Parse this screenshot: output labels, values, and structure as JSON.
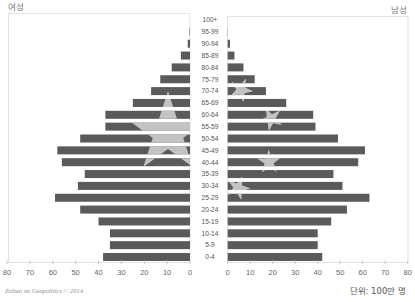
{
  "chart_data": {
    "type": "bar",
    "subtype": "population-pyramid",
    "title": "",
    "xlabel": "",
    "ylabel": "",
    "unit": "단위: 100만 명",
    "categories": [
      "100+",
      "95-99",
      "90-94",
      "85-89",
      "80-84",
      "75-79",
      "70-74",
      "65-69",
      "60-64",
      "55-59",
      "50-54",
      "45-49",
      "40-44",
      "35-39",
      "30-34",
      "25-29",
      "20-24",
      "15-19",
      "10-14",
      "5-9",
      "0-4"
    ],
    "series": [
      {
        "name": "여성",
        "side": "left",
        "values": [
          0,
          0.2,
          1,
          4,
          8,
          13,
          17,
          25,
          37,
          37,
          48,
          58,
          56,
          46,
          49,
          59,
          48,
          40,
          35,
          35,
          38
        ]
      },
      {
        "name": "남성",
        "side": "right",
        "values": [
          0,
          0.1,
          1,
          3,
          7,
          12,
          17,
          26,
          38,
          39,
          49,
          61,
          58,
          47,
          51,
          63,
          53,
          46,
          40,
          40,
          42
        ]
      }
    ],
    "xlim": [
      0,
      80
    ],
    "xticks": [
      "0",
      "10",
      "20",
      "30",
      "40",
      "50",
      "60",
      "70",
      "80"
    ],
    "grid": false,
    "legend": {
      "position": "top",
      "entries": [
        "여성",
        "남성"
      ]
    }
  },
  "labels": {
    "female": "여성",
    "male": "남성",
    "unit": "단위: 100만 명",
    "credit": "Zoltan on Geopolitics © 2014"
  },
  "colors": {
    "bar": "#5a5a5a",
    "star": "#c3c3c3",
    "frame": "#e3e3e3",
    "text": "#666666"
  }
}
